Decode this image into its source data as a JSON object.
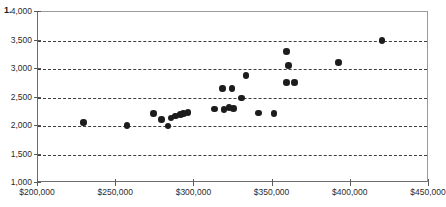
{
  "list_marker": "1.",
  "chart_data": {
    "type": "scatter",
    "title": "",
    "xlabel": "",
    "ylabel": "",
    "xlim": [
      200000,
      450000
    ],
    "ylim": [
      1000,
      4000
    ],
    "grid": true,
    "grid_axis": "y",
    "legend": null,
    "x_ticks": [
      200000,
      250000,
      300000,
      350000,
      400000,
      450000
    ],
    "x_tick_labels": [
      "$200,000",
      "$250,000",
      "$300,000",
      "$350,000",
      "$400,000",
      "$450,000"
    ],
    "y_ticks": [
      1000,
      1500,
      2000,
      2500,
      3000,
      3500,
      4000
    ],
    "y_tick_labels": [
      "1,000",
      "1,500",
      "2,000",
      "2,500",
      "3,000",
      "3,500",
      "4,000"
    ],
    "marker": {
      "shape": "circle",
      "color": "#1c1c1c",
      "size": 6.6
    },
    "points": [
      {
        "x": 229000,
        "y": 2060
      },
      {
        "x": 257000,
        "y": 2010
      },
      {
        "x": 274000,
        "y": 2220
      },
      {
        "x": 279000,
        "y": 2110
      },
      {
        "x": 283000,
        "y": 2000
      },
      {
        "x": 285000,
        "y": 2140
      },
      {
        "x": 288000,
        "y": 2175
      },
      {
        "x": 291000,
        "y": 2200
      },
      {
        "x": 293000,
        "y": 2215
      },
      {
        "x": 296000,
        "y": 2235
      },
      {
        "x": 313000,
        "y": 2300
      },
      {
        "x": 318000,
        "y": 2660
      },
      {
        "x": 319000,
        "y": 2290
      },
      {
        "x": 322000,
        "y": 2320
      },
      {
        "x": 324000,
        "y": 2660
      },
      {
        "x": 325000,
        "y": 2310
      },
      {
        "x": 330000,
        "y": 2490
      },
      {
        "x": 333000,
        "y": 2890
      },
      {
        "x": 341000,
        "y": 2230
      },
      {
        "x": 351000,
        "y": 2220
      },
      {
        "x": 359000,
        "y": 3310
      },
      {
        "x": 360000,
        "y": 3060
      },
      {
        "x": 359000,
        "y": 2760
      },
      {
        "x": 364000,
        "y": 2760
      },
      {
        "x": 392000,
        "y": 3110
      },
      {
        "x": 420000,
        "y": 3500
      }
    ]
  }
}
